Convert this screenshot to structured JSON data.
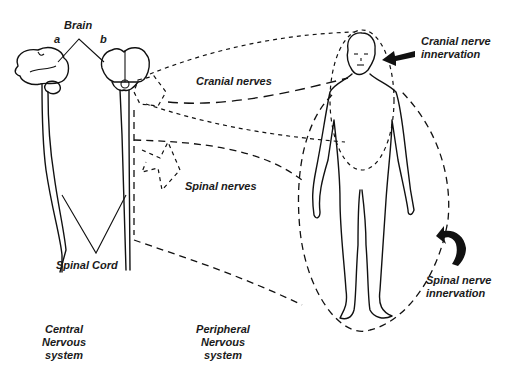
{
  "labels": {
    "brain": "Brain",
    "view_a": "a",
    "view_b": "b",
    "cranial_nerves": "Cranial nerves",
    "spinal_nerves": "Spinal nerves",
    "spinal_cord": "Spinal Cord",
    "cranial_innervation_line1": "Cranial nerve",
    "cranial_innervation_line2": "innervation",
    "spinal_innervation_line1": "Spinal nerve",
    "spinal_innervation_line2": "innervation",
    "cns_line1": "Central",
    "cns_line2": "Nervous",
    "cns_line3": "system",
    "pns_line1": "Peripheral",
    "pns_line2": "Nervous",
    "pns_line3": "system"
  },
  "colors": {
    "line": "#111111",
    "background": "#ffffff",
    "text": "#1a1a1a"
  }
}
